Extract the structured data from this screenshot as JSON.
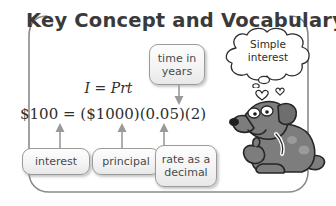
{
  "panel": {
    "title": "Key Concept and Vocabulary",
    "border_color": "#8a8a8a",
    "background": "#ffffff"
  },
  "equations": {
    "formula": "I = Prt",
    "substituted": "$100 = ($1000)(0.05)(2)"
  },
  "callouts": [
    {
      "id": "time-in-years",
      "label": "time in\nyears",
      "line1": "time in",
      "line2": "years"
    },
    {
      "id": "interest",
      "label": "interest",
      "line1": "interest",
      "line2": ""
    },
    {
      "id": "principal",
      "label": "principal",
      "line1": "principal",
      "line2": ""
    },
    {
      "id": "rate-as-a-decimal",
      "label": "rate as a decimal",
      "line1": "rate as a",
      "line2": "decimal"
    }
  ],
  "thought_bubble": {
    "line1": "Simple",
    "line2": "interest"
  },
  "illustration": {
    "character": "cartoon-dog",
    "body_color": "#7d7d7d",
    "outline_color": "#2a2a2a",
    "collar_color": "#ffffff"
  },
  "colors": {
    "text": "#3a3a3a",
    "box_border": "#9a9a9a",
    "box_fill": "#f2f2f2",
    "arrow": "#9a9a9a"
  }
}
